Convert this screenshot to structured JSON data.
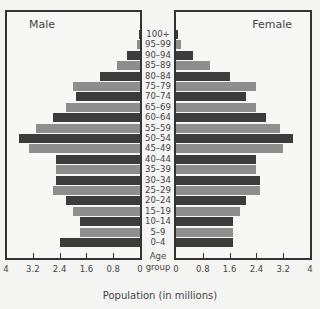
{
  "chart_data": {
    "type": "bar",
    "subtype": "population-pyramid",
    "title": "",
    "xlabel": "Population (in millions)",
    "ylabel": "Age group",
    "xlim": [
      0,
      4
    ],
    "grid": false,
    "panels": [
      "Male",
      "Female"
    ],
    "categories": [
      "100+",
      "95–99",
      "90–94",
      "85–89",
      "80–84",
      "75–79",
      "70–74",
      "65–69",
      "60–64",
      "55–59",
      "50–54",
      "45–49",
      "40–44",
      "35–39",
      "30–34",
      "25–29",
      "20–24",
      "15–19",
      "10–14",
      "5–9",
      "0–4"
    ],
    "series": [
      {
        "name": "Male",
        "side": "left",
        "values": [
          0.03,
          0.1,
          0.4,
          0.7,
          1.2,
          2.0,
          1.9,
          2.2,
          2.6,
          3.1,
          3.6,
          3.3,
          2.5,
          2.5,
          2.5,
          2.6,
          2.2,
          2.0,
          1.8,
          1.8,
          2.4
        ]
      },
      {
        "name": "Female",
        "side": "right",
        "values": [
          0.05,
          0.15,
          0.5,
          1.0,
          1.6,
          2.4,
          2.1,
          2.4,
          2.7,
          3.1,
          3.5,
          3.2,
          2.4,
          2.4,
          2.5,
          2.5,
          2.1,
          1.9,
          1.7,
          1.7,
          1.7
        ]
      }
    ],
    "left_ticks": [
      "4",
      "3.2",
      "2.4",
      "1.6",
      "0.8",
      "0"
    ],
    "right_ticks": [
      "0",
      "0.8",
      "1.6",
      "2.4",
      "3.2",
      "4"
    ],
    "tick_values": [
      0,
      0.8,
      1.6,
      2.4,
      3.2,
      4
    ],
    "colors": {
      "dark": "#3c3c3c",
      "light": "#8e8e8e"
    }
  },
  "labels": {
    "male": "Male",
    "female": "Female",
    "age_title_1": "Age",
    "age_title_2": "group",
    "xlabel": "Population (in millions)"
  }
}
